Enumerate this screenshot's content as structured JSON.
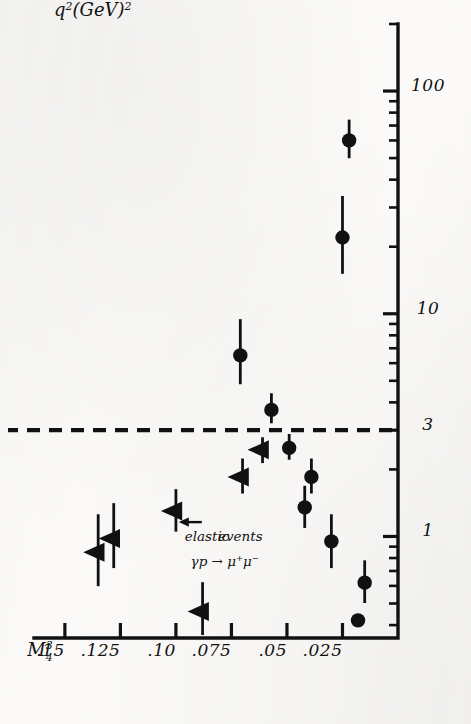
{
  "figure": {
    "kind": "hand-drawn scatter plot on scanned paper",
    "orientation_note": "drawing rotated 90 degrees counter-clockwise on the page",
    "ink_color": "#111111",
    "paper_color": "#fbfaf8"
  },
  "axes": {
    "x": {
      "label_parts": {
        "base": "q",
        "exponent": "2",
        "unit": "(GeV)",
        "unit_exponent": "2"
      },
      "label_text": "q²(GeV)²",
      "scale": "log",
      "tick_labels": [
        "1",
        "3",
        "10",
        "100"
      ],
      "tick_values": [
        1,
        3,
        10,
        100
      ],
      "range": [
        0.35,
        200
      ]
    },
    "y": {
      "label_parts": {
        "base": "M",
        "superscript": "3",
        "subscript": "4"
      },
      "label_text": "M₄³",
      "scale": "linear",
      "tick_labels": [
        ".15",
        ".125",
        ".10",
        ".075",
        ".05",
        ".025"
      ],
      "tick_values": [
        0.15,
        0.125,
        0.1,
        0.075,
        0.05,
        0.025
      ],
      "range": [
        0,
        0.163
      ]
    }
  },
  "annotations": [
    {
      "id": "elastic-events",
      "line1": "elastic",
      "line2": "events",
      "text": "elastic events"
    },
    {
      "id": "reaction",
      "text": "γp → μ⁺μ⁻"
    },
    {
      "id": "pointer-arrow",
      "text": ""
    }
  ],
  "reference_line": {
    "id": "dashed-threshold",
    "style": "dashed",
    "axis": "x",
    "value": 3,
    "label": "3"
  },
  "legend_implicit": [
    {
      "marker": "filled-circle",
      "meaning": "measured point with horizontal error bar"
    },
    {
      "marker": "filled-triangle",
      "meaning": "upper limit with horizontal error bar"
    }
  ],
  "chart_data": {
    "type": "scatter",
    "title": "",
    "xlabel": "q²(GeV)²",
    "ylabel": "M₄³",
    "xscale": "log",
    "xlim": [
      0.35,
      200
    ],
    "ylim": [
      0,
      0.163
    ],
    "grid": false,
    "legend": "none",
    "xticks": [
      1,
      3,
      10,
      100
    ],
    "xticklabels": [
      "1",
      "3",
      "10",
      "100"
    ],
    "yticks": [
      0.025,
      0.05,
      0.075,
      0.1,
      0.125,
      0.15
    ],
    "yticklabels": [
      ".025",
      ".05",
      ".075",
      ".10",
      ".125",
      ".15"
    ],
    "reference_lines": [
      {
        "orientation": "vertical",
        "x": 3,
        "style": "dashed"
      }
    ],
    "series": [
      {
        "name": "measured points",
        "marker": "filled-circle",
        "points": [
          {
            "x": 0.42,
            "y": 0.018,
            "xerr_low": 0.42,
            "xerr_high": 0.42
          },
          {
            "x": 0.62,
            "y": 0.015,
            "xerr_low": 0.5,
            "xerr_high": 0.78
          },
          {
            "x": 0.95,
            "y": 0.03,
            "xerr_low": 0.72,
            "xerr_high": 1.25
          },
          {
            "x": 1.35,
            "y": 0.042,
            "xerr_low": 1.1,
            "xerr_high": 1.7
          },
          {
            "x": 1.85,
            "y": 0.039,
            "xerr_low": 1.55,
            "xerr_high": 2.25
          },
          {
            "x": 2.5,
            "y": 0.049,
            "xerr_low": 2.2,
            "xerr_high": 2.9
          },
          {
            "x": 3.7,
            "y": 0.057,
            "xerr_low": 3.2,
            "xerr_high": 4.4
          },
          {
            "x": 6.5,
            "y": 0.071,
            "xerr_low": 4.8,
            "xerr_high": 9.5
          },
          {
            "x": 22.0,
            "y": 0.025,
            "xerr_low": 15.0,
            "xerr_high": 34.0
          },
          {
            "x": 60.0,
            "y": 0.022,
            "xerr_low": 50.0,
            "xerr_high": 74.0
          }
        ]
      },
      {
        "name": "upper limits",
        "marker": "filled-triangle",
        "points": [
          {
            "x": 0.46,
            "y": 0.088,
            "xerr_low": 0.36,
            "xerr_high": 0.62
          },
          {
            "x": 0.85,
            "y": 0.135,
            "xerr_low": 0.6,
            "xerr_high": 1.25
          },
          {
            "x": 0.98,
            "y": 0.128,
            "xerr_low": 0.72,
            "xerr_high": 1.42
          },
          {
            "x": 1.3,
            "y": 0.1,
            "xerr_low": 1.05,
            "xerr_high": 1.62
          },
          {
            "x": 1.85,
            "y": 0.07,
            "xerr_low": 1.55,
            "xerr_high": 2.25
          },
          {
            "x": 2.45,
            "y": 0.061,
            "xerr_low": 2.15,
            "xerr_high": 2.8
          }
        ]
      }
    ]
  }
}
